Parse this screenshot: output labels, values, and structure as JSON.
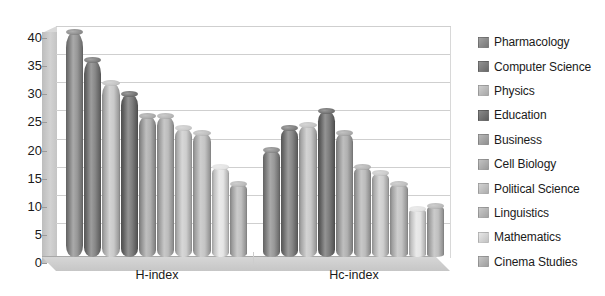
{
  "chart_data": {
    "type": "bar",
    "title": "",
    "subtitle": "",
    "xlabel": "",
    "ylabel": "",
    "categories": [
      "H-index",
      "Hc-index"
    ],
    "ylim": [
      0,
      40
    ],
    "yticks": [
      0,
      5,
      10,
      15,
      20,
      25,
      30,
      35,
      40
    ],
    "ytick_labels": [
      "0",
      "5",
      "10",
      "15",
      "20",
      "25",
      "30",
      "35",
      "40"
    ],
    "grid": true,
    "legend_position": "right",
    "style": "3d-cylinder-grayscale",
    "series": [
      {
        "name": "Pharmacology",
        "color": "#8c8c8c",
        "values": [
          40,
          19
        ]
      },
      {
        "name": "Computer Science",
        "color": "#7a7a7a",
        "values": [
          35,
          23
        ]
      },
      {
        "name": "Physics",
        "color": "#c3c3c3",
        "values": [
          31,
          23.5
        ]
      },
      {
        "name": "Education",
        "color": "#6f6f6f",
        "values": [
          29,
          26
        ]
      },
      {
        "name": "Business",
        "color": "#a8a8a8",
        "values": [
          25,
          22
        ]
      },
      {
        "name": "Cell Biology",
        "color": "#b4b4b4",
        "values": [
          25,
          16
        ]
      },
      {
        "name": "Political Science",
        "color": "#c9c9c9",
        "values": [
          23,
          15
        ]
      },
      {
        "name": "Linguistics",
        "color": "#bdbdbd",
        "values": [
          22,
          13
        ]
      },
      {
        "name": "Mathematics",
        "color": "#e2e2e2",
        "values": [
          16,
          8.5
        ]
      },
      {
        "name": "Cinema Studies",
        "color": "#b9b9b9",
        "values": [
          13,
          9
        ]
      }
    ]
  },
  "legend": {
    "items": [
      {
        "label": "Pharmacology",
        "color": "#8c8c8c"
      },
      {
        "label": "Computer Science",
        "color": "#7a7a7a"
      },
      {
        "label": "Physics",
        "color": "#c3c3c3"
      },
      {
        "label": "Education",
        "color": "#6f6f6f"
      },
      {
        "label": "Business",
        "color": "#a8a8a8"
      },
      {
        "label": "Cell Biology",
        "color": "#b4b4b4"
      },
      {
        "label": "Political Science",
        "color": "#c9c9c9"
      },
      {
        "label": "Linguistics",
        "color": "#bdbdbd"
      },
      {
        "label": "Mathematics",
        "color": "#e2e2e2"
      },
      {
        "label": "Cinema Studies",
        "color": "#b9b9b9"
      }
    ]
  }
}
